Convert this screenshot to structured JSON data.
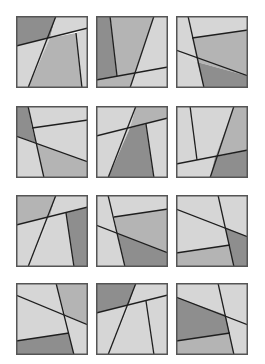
{
  "colors": {
    "light": "#d6d6d6",
    "mid": "#b4b4b4",
    "dark": "#8e8e8e",
    "line": "#1e1e1e",
    "frame": "#555555"
  },
  "tiles": [
    {
      "x": 16,
      "y": 16,
      "polys": [
        [
          "dark",
          "0,0 40,0 34,22 0,30"
        ],
        [
          "light",
          "40,0 72,0 72,12 34,22"
        ],
        [
          "light",
          "0,30 34,22 12,72 0,72"
        ],
        [
          "mid",
          "34,22 60,17 66,72 12,72"
        ],
        [
          "light",
          "60,17 72,12 72,72 66,72"
        ]
      ],
      "lines": [
        [
          "0,30",
          "72,12"
        ],
        [
          "40,0",
          "12,72"
        ],
        [
          "60,17",
          "66,72"
        ]
      ]
    },
    {
      "x": 96,
      "y": 16,
      "polys": [
        [
          "dark",
          "0,0 14,0 21,60 0,64"
        ],
        [
          "mid",
          "14,0 58,0 39,57 21,60"
        ],
        [
          "light",
          "58,0 72,0 72,51 39,57"
        ],
        [
          "mid",
          "0,64 39,57 34,72 0,72"
        ],
        [
          "light",
          "39,57 72,51 72,72 34,72"
        ]
      ],
      "lines": [
        [
          "0,64",
          "72,51"
        ],
        [
          "14,0",
          "21,60"
        ],
        [
          "58,0",
          "34,72"
        ]
      ]
    },
    {
      "x": 176,
      "y": 16,
      "polys": [
        [
          "light",
          "0,0 12,0 21,46 0,34"
        ],
        [
          "light",
          "12,0 72,0 72,14 16,22"
        ],
        [
          "mid",
          "16,22 72,14 72,60 21,46"
        ],
        [
          "light",
          "0,34 21,46 28,72 0,72"
        ],
        [
          "dark",
          "21,46 72,60 72,72 28,72"
        ]
      ],
      "lines": [
        [
          "0,34",
          "72,60"
        ],
        [
          "12,0",
          "28,72"
        ],
        [
          "16,22",
          "72,14"
        ]
      ]
    },
    {
      "x": 16,
      "y": 106,
      "polys": [
        [
          "dark",
          "0,0 12,0 20,37 0,30"
        ],
        [
          "light",
          "12,0 72,0 72,14 16,22"
        ],
        [
          "light",
          "16,22 72,14 72,56 20,37"
        ],
        [
          "light",
          "0,30 20,37 28,72 0,72"
        ],
        [
          "mid",
          "20,37 72,56 72,72 28,72"
        ]
      ],
      "lines": [
        [
          "0,30",
          "72,56"
        ],
        [
          "12,0",
          "28,72"
        ],
        [
          "16,22",
          "72,14"
        ]
      ]
    },
    {
      "x": 96,
      "y": 106,
      "polys": [
        [
          "light",
          "0,0 40,0 34,22 0,30"
        ],
        [
          "mid",
          "40,0 72,0 72,12 34,22"
        ],
        [
          "light",
          "0,30 34,22 12,72 0,72"
        ],
        [
          "dark",
          "34,22 50,18 58,72 12,72"
        ],
        [
          "light",
          "50,18 72,12 72,72 58,72"
        ]
      ],
      "lines": [
        [
          "0,30",
          "72,12"
        ],
        [
          "40,0",
          "12,72"
        ],
        [
          "50,18",
          "58,72"
        ]
      ]
    },
    {
      "x": 176,
      "y": 106,
      "polys": [
        [
          "light",
          "0,0 14,0 21,54 0,58"
        ],
        [
          "light",
          "14,0 58,0 39,51 21,54"
        ],
        [
          "mid",
          "58,0 72,0 72,44 39,51"
        ],
        [
          "light",
          "0,58 39,51 34,72 0,72"
        ],
        [
          "dark",
          "39,51 72,44 72,72 34,72"
        ]
      ],
      "lines": [
        [
          "0,58",
          "72,44"
        ],
        [
          "14,0",
          "21,54"
        ],
        [
          "58,0",
          "34,72"
        ]
      ]
    },
    {
      "x": 16,
      "y": 195,
      "polys": [
        [
          "mid",
          "0,0 40,0 34,22 0,30"
        ],
        [
          "light",
          "40,0 72,0 72,12 34,22"
        ],
        [
          "light",
          "0,30 34,22 12,72 0,72"
        ],
        [
          "light",
          "34,22 50,18 58,72 12,72"
        ],
        [
          "dark",
          "50,18 72,12 72,72 58,72"
        ]
      ],
      "lines": [
        [
          "0,30",
          "72,12"
        ],
        [
          "40,0",
          "12,72"
        ],
        [
          "50,18",
          "58,72"
        ]
      ]
    },
    {
      "x": 96,
      "y": 195,
      "polys": [
        [
          "light",
          "0,0 12,0 21,38 0,30"
        ],
        [
          "light",
          "12,0 72,0 72,14 18,22"
        ],
        [
          "mid",
          "18,22 72,14 72,58 21,38"
        ],
        [
          "light",
          "0,30 21,38 29,72 0,72"
        ],
        [
          "dark",
          "21,38 72,58 72,72 29,72"
        ]
      ],
      "lines": [
        [
          "0,30",
          "72,58"
        ],
        [
          "12,0",
          "29,72"
        ],
        [
          "18,22",
          "72,14"
        ]
      ]
    },
    {
      "x": 176,
      "y": 195,
      "polys": [
        [
          "light",
          "0,0 42,0 49,32 0,14"
        ],
        [
          "light",
          "42,0 72,0 72,42 49,32"
        ],
        [
          "light",
          "0,14 49,32 54,50 0,58"
        ],
        [
          "mid",
          "0,58 54,50 58,72 0,72"
        ],
        [
          "dark",
          "49,32 72,42 72,72 58,72"
        ]
      ],
      "lines": [
        [
          "0,14",
          "72,42"
        ],
        [
          "42,0",
          "58,72"
        ],
        [
          "0,58",
          "54,50"
        ]
      ]
    },
    {
      "x": 16,
      "y": 283,
      "polys": [
        [
          "light",
          "0,0 40,0 49,32 0,12"
        ],
        [
          "mid",
          "40,0 72,0 72,42 49,32"
        ],
        [
          "light",
          "0,12 49,32 53,50 0,58"
        ],
        [
          "dark",
          "0,58 53,50 58,72 0,72"
        ],
        [
          "light",
          "49,32 72,42 72,72 58,72"
        ]
      ],
      "lines": [
        [
          "0,12",
          "72,42"
        ],
        [
          "40,0",
          "58,72"
        ],
        [
          "0,58",
          "53,50"
        ]
      ]
    },
    {
      "x": 96,
      "y": 283,
      "polys": [
        [
          "dark",
          "0,0 40,0 33,22 0,30"
        ],
        [
          "light",
          "40,0 72,0 72,12 33,22"
        ],
        [
          "light",
          "0,30 33,22 12,72 0,72"
        ],
        [
          "light",
          "33,22 50,18 58,72 12,72"
        ],
        [
          "light",
          "50,18 72,12 72,72 58,72"
        ]
      ],
      "lines": [
        [
          "0,30",
          "72,12"
        ],
        [
          "40,0",
          "12,72"
        ],
        [
          "50,18",
          "58,72"
        ]
      ]
    },
    {
      "x": 176,
      "y": 283,
      "polys": [
        [
          "light",
          "0,0 42,0 50,32 0,14"
        ],
        [
          "light",
          "42,0 72,0 72,42 50,32"
        ],
        [
          "dark",
          "0,14 50,32 54,50 0,58"
        ],
        [
          "mid",
          "0,58 54,50 58,72 0,72"
        ],
        [
          "light",
          "50,32 72,42 72,72 58,72"
        ]
      ],
      "lines": [
        [
          "0,14",
          "72,42"
        ],
        [
          "42,0",
          "58,72"
        ],
        [
          "0,58",
          "54,50"
        ]
      ]
    }
  ]
}
